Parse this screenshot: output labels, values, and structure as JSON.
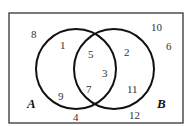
{
  "diagram": {
    "type": "venn",
    "universal_set": {
      "x": 9,
      "y": 13,
      "width": 174,
      "height": 110
    },
    "sets": [
      {
        "label": "A",
        "cx": 76,
        "cy": 69,
        "r": 40,
        "label_pos": [
          27,
          104
        ]
      },
      {
        "label": "B",
        "cx": 114,
        "cy": 69,
        "r": 40,
        "label_pos": [
          157,
          104
        ]
      }
    ],
    "regions": {
      "A_only": [
        "1",
        "9"
      ],
      "A_and_B": [
        "5",
        "3",
        "7"
      ],
      "B_only": [
        "2",
        "11"
      ],
      "outside": [
        "8",
        "10",
        "6",
        "4",
        "12"
      ]
    },
    "numbers": [
      {
        "value": "8",
        "x": 34,
        "y": 35
      },
      {
        "value": "1",
        "x": 62,
        "y": 47
      },
      {
        "value": "5",
        "x": 91,
        "y": 55
      },
      {
        "value": "2",
        "x": 127,
        "y": 53
      },
      {
        "value": "10",
        "x": 156,
        "y": 28
      },
      {
        "value": "6",
        "x": 169,
        "y": 47
      },
      {
        "value": "3",
        "x": 105,
        "y": 74
      },
      {
        "value": "9",
        "x": 61,
        "y": 97
      },
      {
        "value": "7",
        "x": 89,
        "y": 90
      },
      {
        "value": "11",
        "x": 132,
        "y": 90
      },
      {
        "value": "4",
        "x": 76,
        "y": 121
      },
      {
        "value": "12",
        "x": 133,
        "y": 117
      }
    ]
  },
  "colors": {
    "line": "#111111",
    "text": "#333333",
    "background": "#ffffff"
  }
}
